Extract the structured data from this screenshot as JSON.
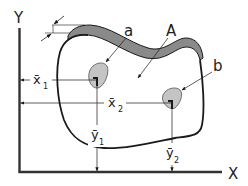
{
  "diagram": {
    "axes": {
      "x_label": "X",
      "y_label": "Y"
    },
    "region": {
      "label": "A",
      "description": "thin-walled closed cross-section with shaded band along top edge"
    },
    "sub_areas": [
      {
        "label": "a",
        "centroid_x_label": "x̄",
        "centroid_x_sub": "1",
        "centroid_y_label": "ȳ",
        "centroid_y_sub": "1"
      },
      {
        "label": "b",
        "centroid_x_label": "x̄",
        "centroid_x_sub": "2",
        "centroid_y_label": "ȳ",
        "centroid_y_sub": "2"
      }
    ],
    "colors": {
      "line": "#1a1a1a",
      "band_fill": "#8a8a8a",
      "blob_fill": "#c4c4c4",
      "background": "#ffffff"
    }
  }
}
